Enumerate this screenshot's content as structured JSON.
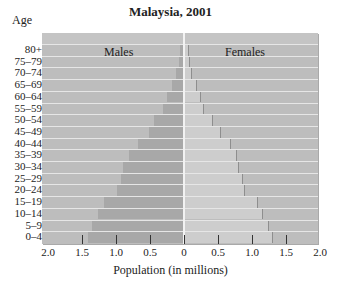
{
  "chart_data": {
    "type": "bar",
    "subtype": "population-pyramid",
    "title": "Malaysia, 2001",
    "ylabel": "Age",
    "xlabel": "Population (in millions)",
    "xlim": [
      -2.0,
      2.0
    ],
    "x_ticks": [
      "2.0",
      "1.5",
      "1.0",
      "0.5",
      "0",
      "0.5",
      "1.0",
      "1.5",
      "2.0"
    ],
    "legend": [
      "Males",
      "Females"
    ],
    "categories": [
      "80+",
      "75–79",
      "70–74",
      "65–69",
      "60–64",
      "55–59",
      "50–54",
      "45–49",
      "40–44",
      "35–39",
      "30–34",
      "25–29",
      "20–24",
      "15–19",
      "10–14",
      "5–9",
      "0–4"
    ],
    "series": [
      {
        "name": "Males",
        "color": "#a8a8a8",
        "values": [
          0.06,
          0.08,
          0.12,
          0.18,
          0.25,
          0.31,
          0.44,
          0.52,
          0.68,
          0.81,
          0.89,
          0.93,
          0.98,
          1.17,
          1.27,
          1.35,
          1.41
        ]
      },
      {
        "name": "Females",
        "color": "#cdcdcd",
        "values": [
          0.06,
          0.08,
          0.1,
          0.17,
          0.24,
          0.28,
          0.41,
          0.53,
          0.67,
          0.77,
          0.8,
          0.86,
          0.88,
          1.08,
          1.15,
          1.24,
          1.29
        ]
      }
    ],
    "grid": false,
    "legend_position": "inside-top"
  },
  "labels": {
    "title": "Malaysia, 2001",
    "age": "Age",
    "males": "Males",
    "females": "Females",
    "xlabel": "Population (in millions)"
  }
}
